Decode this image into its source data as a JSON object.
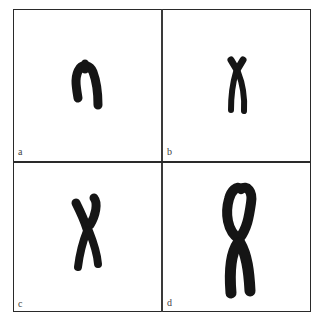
{
  "figure": {
    "panels": [
      {
        "id": "a",
        "label": "a"
      },
      {
        "id": "b",
        "label": "b"
      },
      {
        "id": "c",
        "label": "c"
      },
      {
        "id": "d",
        "label": "d"
      }
    ],
    "colors": {
      "chromosome": "#151515",
      "border": "#2a2a2a",
      "background": "#ffffff",
      "label": "#444444"
    }
  }
}
